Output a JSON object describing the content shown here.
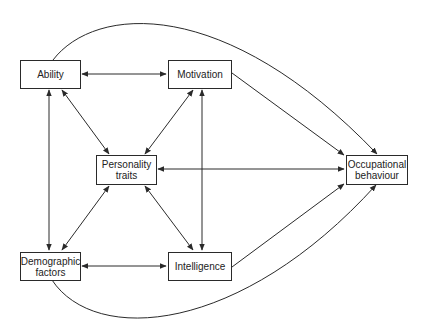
{
  "diagram": {
    "type": "directed-graph",
    "nodes": {
      "ability": {
        "label": "Ability"
      },
      "motivation": {
        "label": "Motivation"
      },
      "personality": {
        "line1": "Personality",
        "line2": "traits"
      },
      "occupational": {
        "line1": "Occupational",
        "line2": "behaviour"
      },
      "demographic": {
        "line1": "Demographic",
        "line2": "factors"
      },
      "intelligence": {
        "label": "Intelligence"
      }
    },
    "edges": [
      {
        "from": "Ability",
        "to": "Motivation",
        "direction": "both"
      },
      {
        "from": "Ability",
        "to": "Personality traits",
        "direction": "both"
      },
      {
        "from": "Ability",
        "to": "Demographic factors",
        "direction": "both"
      },
      {
        "from": "Ability",
        "to": "Occupational behaviour",
        "direction": "forward",
        "curved": true
      },
      {
        "from": "Motivation",
        "to": "Personality traits",
        "direction": "both"
      },
      {
        "from": "Motivation",
        "to": "Intelligence",
        "direction": "both"
      },
      {
        "from": "Motivation",
        "to": "Occupational behaviour",
        "direction": "forward"
      },
      {
        "from": "Personality traits",
        "to": "Occupational behaviour",
        "direction": "both"
      },
      {
        "from": "Personality traits",
        "to": "Demographic factors",
        "direction": "both"
      },
      {
        "from": "Personality traits",
        "to": "Intelligence",
        "direction": "both"
      },
      {
        "from": "Demographic factors",
        "to": "Intelligence",
        "direction": "both"
      },
      {
        "from": "Demographic factors",
        "to": "Occupational behaviour",
        "direction": "forward",
        "curved": true
      },
      {
        "from": "Intelligence",
        "to": "Occupational behaviour",
        "direction": "forward"
      }
    ],
    "line_color": "#2a2a2a"
  }
}
